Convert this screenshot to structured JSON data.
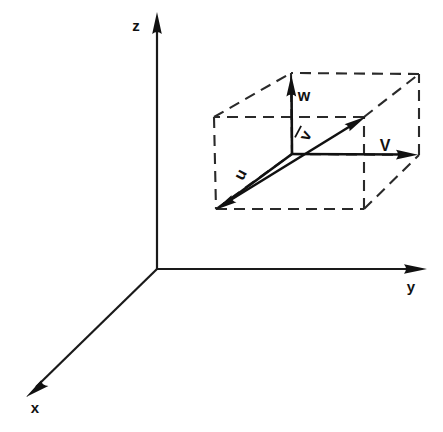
{
  "figure": {
    "background_color": "#ffffff",
    "line_color": "#111111",
    "width": 443,
    "height": 432
  },
  "axes": {
    "origin": {
      "x": 157,
      "y": 269
    },
    "items": [
      {
        "name": "x",
        "label": "x",
        "label_x": 34,
        "label_y": 412,
        "from": {
          "x": 157,
          "y": 269
        },
        "to": {
          "x": 27,
          "y": 396
        },
        "arrow": "solid-triangle"
      },
      {
        "name": "y",
        "label": "y",
        "label_x": 411,
        "label_y": 292,
        "from": {
          "x": 157,
          "y": 269
        },
        "to": {
          "x": 426,
          "y": 269
        },
        "arrow": "solid-triangle"
      },
      {
        "name": "z",
        "label": "z",
        "label_x": 136,
        "label_y": 31,
        "from": {
          "x": 157,
          "y": 269
        },
        "to": {
          "x": 157,
          "y": 13
        },
        "arrow": "solid-triangle"
      }
    ]
  },
  "parallelepiped": {
    "style": "dashed",
    "dash_pattern": "11 7",
    "vertices": {
      "front_bottom_left": {
        "x": 216,
        "y": 209
      },
      "front_bottom_right": {
        "x": 364,
        "y": 209
      },
      "front_top_left": {
        "x": 214,
        "y": 117
      },
      "front_top_right": {
        "x": 364,
        "y": 117
      },
      "back_bottom_left": {
        "x": 292,
        "y": 154
      },
      "back_bottom_right": {
        "x": 419,
        "y": 155
      },
      "back_top_left": {
        "x": 291,
        "y": 73
      },
      "back_top_right": {
        "x": 419,
        "y": 74
      }
    }
  },
  "vectors": [
    {
      "name": "u",
      "label": "u",
      "label_x": 244,
      "label_y": 176,
      "label_rotation": -62,
      "from": {
        "x": 292,
        "y": 154
      },
      "to": {
        "x": 216,
        "y": 209
      },
      "arrow": "solid-triangle",
      "description": "component along x direction, points to front bottom left"
    },
    {
      "name": "v",
      "label": "V",
      "label_x": 379,
      "label_y": 150,
      "label_rotation": 0,
      "from": {
        "x": 292,
        "y": 154
      },
      "to": {
        "x": 417,
        "y": 155
      },
      "arrow": "solid-triangle",
      "description": "component along y direction, points right"
    },
    {
      "name": "w",
      "label": "w",
      "label_x": 296,
      "label_y": 101,
      "label_rotation": 0,
      "from": {
        "x": 292,
        "y": 154
      },
      "to": {
        "x": 291,
        "y": 76
      },
      "arrow": "solid-triangle",
      "description": "component along z direction, points up"
    },
    {
      "name": "resultant",
      "label": "v",
      "label_overbar": true,
      "label_x": 308,
      "label_y": 138,
      "label_rotation": -60,
      "from": {
        "x": 216,
        "y": 209
      },
      "to": {
        "x": 365,
        "y": 117
      },
      "arrow": "solid-triangle",
      "description": "resultant vector v-bar, diagonal of the parallelepiped"
    }
  ]
}
